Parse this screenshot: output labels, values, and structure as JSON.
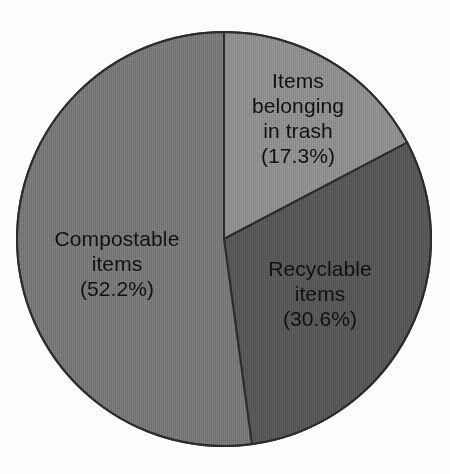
{
  "chart_data": {
    "type": "pie",
    "title": "",
    "subtitle": "",
    "xlabel": "",
    "ylabel": "",
    "legend_position": "none",
    "grid": false,
    "labels_inside_slices": true,
    "start_angle_deg": 0,
    "direction": "clockwise",
    "categories": [
      "Items belonging in trash",
      "Recyclable items",
      "Compostable items"
    ],
    "values": [
      17.3,
      30.6,
      52.2
    ],
    "value_unit": "%",
    "slices": [
      {
        "name": "Items belonging in trash",
        "value": 17.3,
        "value_text": "(17.3%)",
        "label_lines": [
          "Items",
          "belonging",
          "in trash",
          "(17.3%)"
        ],
        "color": "#8d8d8d"
      },
      {
        "name": "Recyclable items",
        "value": 30.6,
        "value_text": "(30.6%)",
        "label_lines": [
          "Recyclable",
          "items",
          "(30.6%)"
        ],
        "color": "#565656"
      },
      {
        "name": "Compostable items",
        "value": 52.2,
        "value_text": "(52.2%)",
        "label_lines": [
          "Compostable",
          "items",
          "(52.2%)"
        ],
        "color": "#767676"
      }
    ]
  },
  "colors": {
    "background": "#fdfdfc",
    "slice_border": "#2b2b2b",
    "label_text": "#111111",
    "trash_slice": "#8d8d8d",
    "recyclable_slice": "#565656",
    "compostable_slice": "#767676"
  },
  "labels": {
    "trash": {
      "line1": "Items",
      "line2": "belonging",
      "line3": "in trash",
      "line4": "(17.3%)"
    },
    "recyclable": {
      "line1": "Recyclable",
      "line2": "items",
      "line3": "(30.6%)"
    },
    "compostable": {
      "line1": "Compostable",
      "line2": "items",
      "line3": "(52.2%)"
    }
  }
}
